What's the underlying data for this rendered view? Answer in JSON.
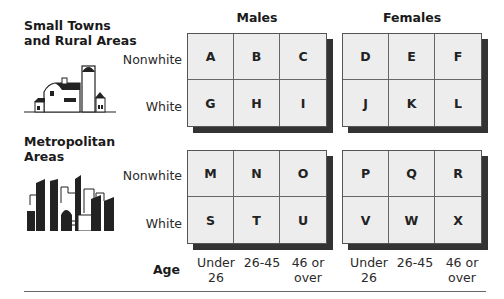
{
  "sections": [
    {
      "title_line1": "Small Towns",
      "title_line2": "and Rural Areas",
      "icon": "farm-barn-icon"
    },
    {
      "title_line1": "Metropolitan",
      "title_line2": "Areas",
      "icon": "city-skyline-icon"
    }
  ],
  "groups": {
    "males": "Males",
    "females": "Females"
  },
  "row_labels": {
    "nonwhite": "Nonwhite",
    "white": "White"
  },
  "age": {
    "label": "Age",
    "columns": [
      {
        "line1": "Under",
        "line2": "26"
      },
      {
        "line1": "26-45",
        "line2": ""
      },
      {
        "line1": "46 or",
        "line2": "over"
      }
    ]
  },
  "cells": {
    "rural_male": [
      "A",
      "B",
      "C",
      "G",
      "H",
      "I"
    ],
    "rural_female": [
      "D",
      "E",
      "F",
      "J",
      "K",
      "L"
    ],
    "metro_male": [
      "M",
      "N",
      "O",
      "S",
      "T",
      "U"
    ],
    "metro_female": [
      "P",
      "Q",
      "R",
      "V",
      "W",
      "X"
    ]
  },
  "colors": {
    "cell_bg": "#ededed",
    "shadow": "#333333",
    "grid_line": "#555555"
  }
}
